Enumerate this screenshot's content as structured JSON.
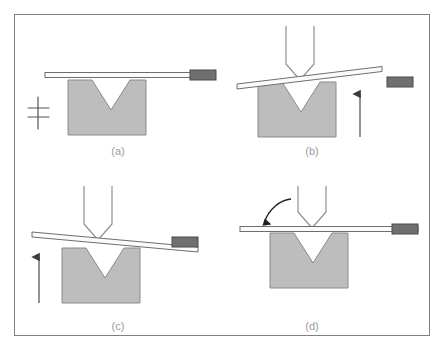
{
  "figure": {
    "type": "technical-diagram",
    "background_color": "#ffffff",
    "frame": {
      "name": "outer-border",
      "x": 14,
      "y": 14,
      "width": 416,
      "height": 322,
      "stroke": "#808080",
      "stroke_width": 1,
      "fill": "none"
    },
    "colors": {
      "die_fill": "#bdbdbd",
      "die_stroke": "#8a8a8a",
      "sheet_fill": "#fbfbfb",
      "sheet_stroke": "#6e6e6e",
      "gripper_fill": "#707070",
      "gripper_stroke": "#4a4a4a",
      "punch_stroke": "#8f8f8f",
      "punch_fill": "#ffffff",
      "arrow_color": "#3a3a3a",
      "label_color": "#9a9a9a",
      "support_symbol_color": "#555555"
    },
    "panels": [
      {
        "id": "a",
        "label": "(a)",
        "label_x": 118,
        "label_y": 155,
        "description": "Sheet clamped flat on die, punch not engaged",
        "origin_x": 0,
        "origin_y": 0,
        "die": {
          "x": 68,
          "y": 80,
          "width": 78,
          "height": 55,
          "notch_top_left": 92,
          "notch_top_right": 130,
          "notch_depth": 30
        },
        "sheet": {
          "x1": 45,
          "y1": 75,
          "x2": 190,
          "y2": 75,
          "thickness": 5,
          "tilt": "flat"
        },
        "gripper": {
          "x": 190,
          "y": 71,
          "width": 26,
          "height": 10
        },
        "punch": null,
        "straight_arrow": null,
        "curved_arrow": null,
        "support_symbol": {
          "x": 38,
          "y": 112
        }
      },
      {
        "id": "b",
        "label": "(b)",
        "label_x": 312,
        "label_y": 155,
        "description": "Punch descends, sheet bends upward, gripper released",
        "origin_x": 222,
        "origin_y": 0,
        "die": {
          "x": 258,
          "y": 82,
          "width": 78,
          "height": 55,
          "notch_top_left": 282,
          "notch_top_right": 320,
          "notch_depth": 30
        },
        "sheet": {
          "x1": 237,
          "y1": 85,
          "x2": 382,
          "y2": 68,
          "thickness": 5,
          "tilt": "up-right"
        },
        "gripper": {
          "x": 387,
          "y": 78,
          "width": 26,
          "height": 10
        },
        "punch": {
          "cx": 300,
          "top_y": 26,
          "width": 28,
          "body_height": 38,
          "tip_y": 80
        },
        "straight_arrow": {
          "x": 360,
          "y_start": 137,
          "y_end": 92,
          "direction": "up"
        },
        "curved_arrow": null,
        "support_symbol": null
      },
      {
        "id": "c",
        "label": "(c)",
        "label_x": 118,
        "label_y": 330,
        "description": "Sheet over-bent, tilted down to the right, die rising",
        "origin_x": 0,
        "origin_y": 175,
        "die": {
          "x": 62,
          "y": 248,
          "width": 78,
          "height": 55,
          "notch_top_left": 86,
          "notch_top_right": 124,
          "notch_depth": 30
        },
        "sheet": {
          "x1": 32,
          "y1": 234,
          "x2": 172,
          "y2": 249,
          "thickness": 5,
          "tilt": "down-right"
        },
        "gripper": {
          "x": 172,
          "y": 238,
          "width": 26,
          "height": 10
        },
        "punch": {
          "cx": 98,
          "top_y": 186,
          "width": 28,
          "body_height": 38,
          "tip_y": 240
        },
        "straight_arrow": {
          "x": 39,
          "y_start": 300,
          "y_end": 255,
          "direction": "up"
        },
        "curved_arrow": null,
        "support_symbol": null
      },
      {
        "id": "d",
        "label": "(d)",
        "label_x": 312,
        "label_y": 330,
        "description": "Springback returns sheet toward flat, gripper reattached",
        "origin_x": 222,
        "origin_y": 175,
        "die": {
          "x": 270,
          "y": 233,
          "width": 78,
          "height": 55,
          "notch_top_left": 294,
          "notch_top_right": 332,
          "notch_depth": 30
        },
        "sheet": {
          "x1": 240,
          "y1": 229,
          "x2": 392,
          "y2": 229,
          "thickness": 5,
          "tilt": "flat"
        },
        "gripper": {
          "x": 392,
          "y": 225,
          "width": 26,
          "height": 10
        },
        "punch": {
          "cx": 312,
          "top_y": 186,
          "width": 28,
          "body_height": 38,
          "tip_y": 228
        },
        "straight_arrow": null,
        "curved_arrow": {
          "start_x": 288,
          "start_y": 202,
          "end_x": 264,
          "end_y": 231,
          "direction": "down-left"
        },
        "support_symbol": null
      }
    ]
  }
}
